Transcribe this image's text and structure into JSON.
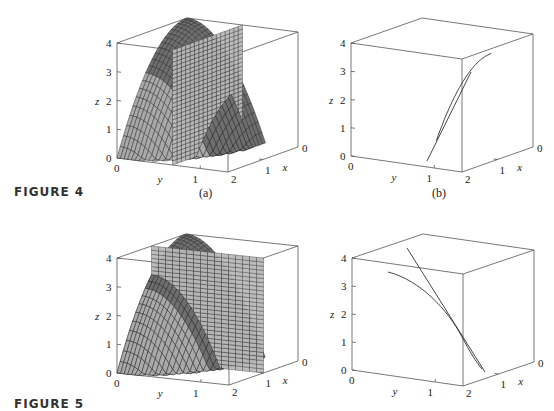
{
  "figures": [
    {
      "label": "FIGURE 4",
      "panels": [
        {
          "caption": "(a)"
        },
        {
          "caption": "(b)"
        }
      ]
    },
    {
      "label": "FIGURE 5",
      "panels": [
        {
          "caption": ""
        },
        {
          "caption": ""
        }
      ]
    }
  ],
  "axes": {
    "z_label": "z",
    "y_label": "y",
    "x_label": "x",
    "z_ticks": [
      "0",
      "1",
      "2",
      "3",
      "4"
    ],
    "y_ticks": [
      "0",
      "1",
      "2"
    ],
    "x_ticks": [
      "0",
      "1",
      "2"
    ]
  },
  "colors": {
    "surface": "#6e6e6e",
    "surface_light": "#a9a9a9",
    "plane": "#b9b9b9",
    "mesh": "#222222",
    "box": "#555555"
  },
  "chart_data": [
    {
      "type": "surface3d",
      "title": "FIGURE 4 (a)",
      "surface": "z = 4 - x^2 - 2y^2",
      "plane": "y = 1 (vertical)",
      "xlim": [
        0,
        2
      ],
      "ylim": [
        0,
        2
      ],
      "zlim": [
        0,
        4
      ],
      "xlabel": "x",
      "ylabel": "y",
      "zlabel": "z"
    },
    {
      "type": "line3d",
      "title": "FIGURE 4 (b)",
      "series": [
        {
          "name": "trace curve"
        },
        {
          "name": "tangent line"
        }
      ],
      "xlim": [
        0,
        2
      ],
      "ylim": [
        0,
        2
      ],
      "zlim": [
        0,
        4
      ]
    },
    {
      "type": "surface3d",
      "title": "FIGURE 5 (a)",
      "surface": "z = 4 - x^2 - 2y^2",
      "plane": "x = 1 (vertical)",
      "xlim": [
        0,
        2
      ],
      "ylim": [
        0,
        2
      ],
      "zlim": [
        0,
        4
      ]
    },
    {
      "type": "line3d",
      "title": "FIGURE 5 (b)",
      "series": [
        {
          "name": "trace curve"
        },
        {
          "name": "tangent line"
        }
      ],
      "xlim": [
        0,
        2
      ],
      "ylim": [
        0,
        2
      ],
      "zlim": [
        0,
        4
      ]
    }
  ]
}
